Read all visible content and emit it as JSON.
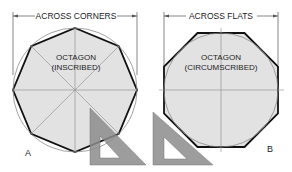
{
  "figure_a": {
    "dimension_label": "ACROSS CORNERS",
    "shape_title": "OCTAGON",
    "shape_subtitle": "(INSCRIBED)",
    "figure_letter": "A"
  },
  "figure_b": {
    "dimension_label": "ACROSS FLATS",
    "shape_title": "OCTAGON",
    "shape_subtitle": "(CIRCUMSCRIBED)",
    "figure_letter": "B"
  },
  "colors": {
    "fill": "#e2e2e2",
    "outline": "#111111",
    "construction": "#8a8a8a",
    "triangle": "#8c8c8c"
  }
}
